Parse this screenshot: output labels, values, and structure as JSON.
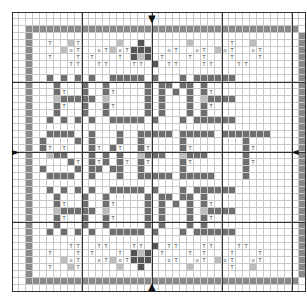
{
  "grid": {
    "cols": 42,
    "rows": 40,
    "cell_px": 7
  },
  "symbols": {
    "T": "T",
    "O": "o"
  },
  "legend_colors": {
    "d": "#6e6e6e",
    "m": "#9a9a9a",
    "l": "#bdbdbd",
    "b": "#8a8a8a",
    "x": "#555555"
  },
  "text_rows": [
    "HOME",
    "SWEET",
    "HOME"
  ],
  "arrows": {
    "top": "▼",
    "bottom": "▲",
    "left": "►",
    "right": "◄"
  },
  "rows": [
    "..........................................",
    "..........................................",
    "..bbbbbbbbbbbbbbbbbbbbbbbbbbbbbbbbbbbbbbb.",
    "..b......................................b",
    "..b..T..lT.....l..x......l.....T..l......b",
    "..b....lOT..OTlOTxxx..OT..OT.lOT..OT.....b",
    "..b..T...T.T...T.xlx.T...T.T...T...T.....b",
    "..b.....TT..TT...TT.x.TT...TT...TT.......b",
    "..b......................................b",
    "..b..d.d.d.d..ddddd.d...d.dddddd.........b",
    "..b...d...d..d.....d.dd.dd.d.............b",
    "..b...dT..d..dT....d.d.d.d.dT............b",
    "..b...lddddd.l.....d.d...d.ldddd.........b",
    "..b...dT..d..dT....d.d...d.dT............b",
    "..b...d...d..d.....d.d...d.d.............b",
    "..b..d.d.d.d..ddddd.d...d.dddddd.........b",
    "..b......................................b",
    "..b..dddd..d...d..ddddd.ddddd.ddddddd....b",
    "..b.d....d.d...d..d.....d........d.......b",
    "..b.dT.T...dT.dT..dT....dT.......dT......b",
    "..b..ldd...d.d.d..lddd..lddd.....d.......b",
    "..b.....dT.dTd.dT.dT....dT.......dT......b",
    "..b.d....d.dd.dd..d.....d........d.......b",
    "..b..dddd..d...d..ddddd.ddddd....d.......b",
    "..b......................................b",
    "..b..d.d.d.d..ddddd.d...d.dddddd.........b",
    "..b...d...d..d.....d.dd.dd.d.............b",
    "..b...dT..d..dT....d.d.d.d.dT............b",
    "..b...lddddd.l.....d.d...d.ldddd.........b",
    "..b...dT..d..dT....d.d...d.dT............b",
    "..b...d...d..d.....d.d...d.d.............b",
    "..b..d.d.d.d..ddddd.d...d.dddddd.........b",
    "..b......................................b",
    "..b.....TT..TT...TT.x.TT...TT...TT.......b",
    "..b..T...T.T...T.xlx.T...T.T...T...T.....b",
    "..b....lOT..OTlOTxxx..OT..OT.lOT..OT.....b",
    "..b..T..lT.....l..x......l.....T..l......b",
    "..b......................................b",
    "..bbbbbbbbbbbbbbbbbbbbbbbbbbbbbbbbbbbbbbb.",
    ".........................................."
  ]
}
